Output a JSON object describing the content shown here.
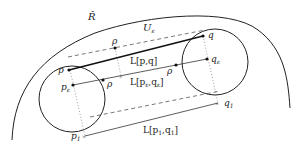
{
  "diagram": {
    "region_label": "R̂",
    "tube_label": "U",
    "tube_sub": "ε",
    "points": {
      "p": "p",
      "q": "q",
      "p_eps": "p",
      "p_eps_sub": "ε",
      "q_eps": "q",
      "q_eps_sub": "ε",
      "p1": "p",
      "p1_sub": "1",
      "q1": "q",
      "q1_sub": "1"
    },
    "rho": "ρ",
    "segments": {
      "L_pq": "L[p,q]",
      "L_peps": "L[p",
      "L_peps_sub": "ε",
      "L_peps_mid": ",q",
      "L_peps_sub2": "ε",
      "L_peps_end": "]",
      "L_p1": "L[p",
      "L_p1_sub": "1",
      "L_p1_mid": ",q",
      "L_p1_sub2": "1",
      "L_p1_end": "]"
    },
    "colors": {
      "stroke": "#222222",
      "dashed": "#555555",
      "background": "#ffffff"
    }
  }
}
